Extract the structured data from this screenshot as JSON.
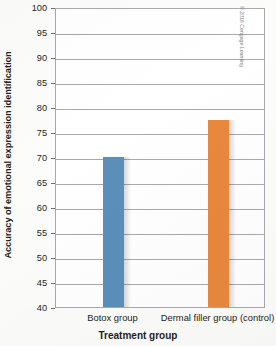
{
  "chart_data": {
    "type": "bar",
    "title": "",
    "subtitle": "",
    "xlabel": "Treatment group",
    "ylabel": "Accuracy of emotional expression identification",
    "categories": [
      "Botox group",
      "Dermal filler group (control)"
    ],
    "values": [
      70,
      77.5
    ],
    "series": [
      {
        "name": "Accuracy of emotional expression identification",
        "values": [
          70,
          77.5
        ]
      }
    ],
    "ylim": [
      40,
      100
    ],
    "ytick_step": 5,
    "ytick_labels": [
      "100",
      "95",
      "90",
      "85",
      "80",
      "75",
      "70",
      "65",
      "60",
      "55",
      "50",
      "45",
      "40"
    ],
    "ytick_values": [
      100,
      95,
      90,
      85,
      80,
      75,
      70,
      65,
      60,
      55,
      50,
      45,
      40
    ],
    "grid": true,
    "grid_axis": "y",
    "legend": false,
    "legend_position": "none",
    "bar_colors": [
      "#5b8fb9",
      "#e8883c"
    ],
    "annotations": []
  },
  "colors": {
    "bar_blue": "#5b8fb9",
    "bar_orange": "#e8883c",
    "axis_line": "#a7a9ac",
    "text": "#231f20",
    "plot_background": "#ffffff",
    "page_background": "#fcfcfa",
    "credit_text": "#808285"
  },
  "credit": {
    "text": "© 2016 Cengage Learning"
  }
}
